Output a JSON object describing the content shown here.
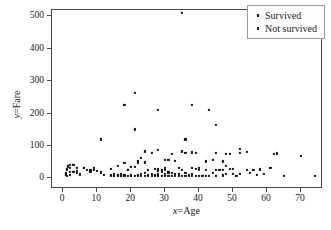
{
  "chart_data": {
    "type": "scatter",
    "title": "",
    "xlabel": "x=Age",
    "ylabel": "y=Fare",
    "xlabel_parts": {
      "var": "x",
      "rest": "=Age"
    },
    "ylabel_parts": {
      "var": "y",
      "rest": "=Fare"
    },
    "xlim": [
      -3.3,
      76.5
    ],
    "ylim": [
      -33,
      520
    ],
    "xticks": [
      0,
      10,
      20,
      30,
      40,
      50,
      60,
      70
    ],
    "yticks": [
      0,
      100,
      200,
      300,
      400,
      500
    ],
    "xtick_labels": [
      "0",
      "10",
      "20",
      "30",
      "40",
      "50",
      "60",
      "70"
    ],
    "ytick_labels": [
      "0",
      "100",
      "200",
      "300",
      "400",
      "500"
    ],
    "grid": false,
    "legend_position": "upper right",
    "marker": "point",
    "marker_color": "#111111",
    "series": [
      {
        "name": "Survived",
        "marker": "point",
        "color": "#111111",
        "points": [
          [
            0.9,
            12
          ],
          [
            0.8,
            17
          ],
          [
            1.0,
            25
          ],
          [
            1.2,
            30
          ],
          [
            1.5,
            37
          ],
          [
            2.0,
            31
          ],
          [
            2.0,
            41
          ],
          [
            3.0,
            41
          ],
          [
            4.0,
            16
          ],
          [
            4.0,
            23
          ],
          [
            5.0,
            12
          ],
          [
            6.0,
            33
          ],
          [
            8.0,
            27
          ],
          [
            9.0,
            31
          ],
          [
            11.0,
            120
          ],
          [
            14.0,
            11
          ],
          [
            14.0,
            30
          ],
          [
            15.0,
            8
          ],
          [
            15.0,
            14
          ],
          [
            16.0,
            39
          ],
          [
            17.0,
            8
          ],
          [
            18.0,
            227
          ],
          [
            18.0,
            48
          ],
          [
            19.0,
            26
          ],
          [
            20.0,
            36
          ],
          [
            21.0,
            151
          ],
          [
            21.0,
            263
          ],
          [
            22.0,
            49
          ],
          [
            22.0,
            55
          ],
          [
            23.0,
            63
          ],
          [
            24.0,
            49
          ],
          [
            24.0,
            83
          ],
          [
            25.0,
            26
          ],
          [
            26.0,
            78
          ],
          [
            27.0,
            30
          ],
          [
            28.0,
            89
          ],
          [
            28.0,
            211
          ],
          [
            29.0,
            26
          ],
          [
            30.0,
            57
          ],
          [
            30.0,
            31
          ],
          [
            31.0,
            57
          ],
          [
            32.0,
            76
          ],
          [
            33.0,
            53
          ],
          [
            34.0,
            32
          ],
          [
            35.0,
            512
          ],
          [
            35.0,
            83
          ],
          [
            36.0,
            120
          ],
          [
            36.0,
            78
          ],
          [
            38.0,
            227
          ],
          [
            38.0,
            80
          ],
          [
            39.0,
            79
          ],
          [
            40.0,
            31
          ],
          [
            42.0,
            52
          ],
          [
            43.0,
            211
          ],
          [
            44.0,
            57
          ],
          [
            45.0,
            164
          ],
          [
            45.0,
            78
          ],
          [
            47.0,
            52
          ],
          [
            48.0,
            76
          ],
          [
            48.0,
            39
          ],
          [
            49.0,
            76
          ],
          [
            50.0,
            28
          ],
          [
            52.0,
            91
          ],
          [
            52.0,
            78
          ],
          [
            54.0,
            82
          ],
          [
            58.0,
            26
          ],
          [
            62.0,
            76
          ],
          [
            63.0,
            77
          ],
          [
            70.0,
            68
          ]
        ]
      },
      {
        "name": "Not survived",
        "marker": "point",
        "color": "#111111",
        "points": [
          [
            1.0,
            8
          ],
          [
            2.0,
            10
          ],
          [
            2.0,
            21
          ],
          [
            3.0,
            21
          ],
          [
            4.0,
            31
          ],
          [
            6.0,
            31
          ],
          [
            7.0,
            26
          ],
          [
            8.0,
            21
          ],
          [
            9.0,
            27
          ],
          [
            10.0,
            24
          ],
          [
            11.0,
            18
          ],
          [
            12.0,
            11
          ],
          [
            14.0,
            7
          ],
          [
            15.0,
            7
          ],
          [
            16.0,
            8
          ],
          [
            16.0,
            10
          ],
          [
            17.0,
            8
          ],
          [
            17.0,
            14
          ],
          [
            18.0,
            7
          ],
          [
            18.0,
            11
          ],
          [
            19.0,
            8
          ],
          [
            19.0,
            26
          ],
          [
            20.0,
            7
          ],
          [
            20.0,
            9
          ],
          [
            21.0,
            8
          ],
          [
            21.0,
            34
          ],
          [
            22.0,
            7
          ],
          [
            22.0,
            10
          ],
          [
            23.0,
            8
          ],
          [
            23.0,
            13
          ],
          [
            24.0,
            8
          ],
          [
            24.0,
            16
          ],
          [
            25.0,
            7
          ],
          [
            25.0,
            11
          ],
          [
            26.0,
            7
          ],
          [
            26.0,
            14
          ],
          [
            27.0,
            7
          ],
          [
            27.0,
            10
          ],
          [
            28.0,
            7
          ],
          [
            28.0,
            9
          ],
          [
            28.0,
            14
          ],
          [
            28.0,
            22
          ],
          [
            28.0,
            26
          ],
          [
            28.0,
            30
          ],
          [
            29.0,
            8
          ],
          [
            29.0,
            21
          ],
          [
            30.0,
            8
          ],
          [
            30.0,
            13
          ],
          [
            30.0,
            27
          ],
          [
            31.0,
            8
          ],
          [
            31.0,
            18
          ],
          [
            32.0,
            8
          ],
          [
            32.0,
            16
          ],
          [
            33.0,
            8
          ],
          [
            33.0,
            12
          ],
          [
            34.0,
            8
          ],
          [
            34.0,
            13
          ],
          [
            35.0,
            8
          ],
          [
            35.0,
            26
          ],
          [
            36.0,
            7
          ],
          [
            36.0,
            16
          ],
          [
            37.0,
            9
          ],
          [
            38.0,
            7
          ],
          [
            38.0,
            13
          ],
          [
            38.0,
            31
          ],
          [
            39.0,
            8
          ],
          [
            39.0,
            29
          ],
          [
            40.0,
            7
          ],
          [
            40.0,
            27
          ],
          [
            41.0,
            8
          ],
          [
            42.0,
            8
          ],
          [
            42.0,
            26
          ],
          [
            43.0,
            8
          ],
          [
            44.0,
            16
          ],
          [
            45.0,
            7
          ],
          [
            45.0,
            27
          ],
          [
            46.0,
            26
          ],
          [
            47.0,
            9
          ],
          [
            47.0,
            25
          ],
          [
            48.0,
            13
          ],
          [
            49.0,
            30
          ],
          [
            50.0,
            13
          ],
          [
            51.0,
            8
          ],
          [
            52.0,
            13
          ],
          [
            54.0,
            26
          ],
          [
            55.0,
            16
          ],
          [
            56.0,
            26
          ],
          [
            57.0,
            10
          ],
          [
            58.0,
            29
          ],
          [
            59.0,
            13
          ],
          [
            61.0,
            33
          ],
          [
            65.0,
            7
          ],
          [
            74.0,
            8
          ]
        ]
      }
    ],
    "legend_entries": [
      "Survived",
      "Not survived"
    ]
  }
}
